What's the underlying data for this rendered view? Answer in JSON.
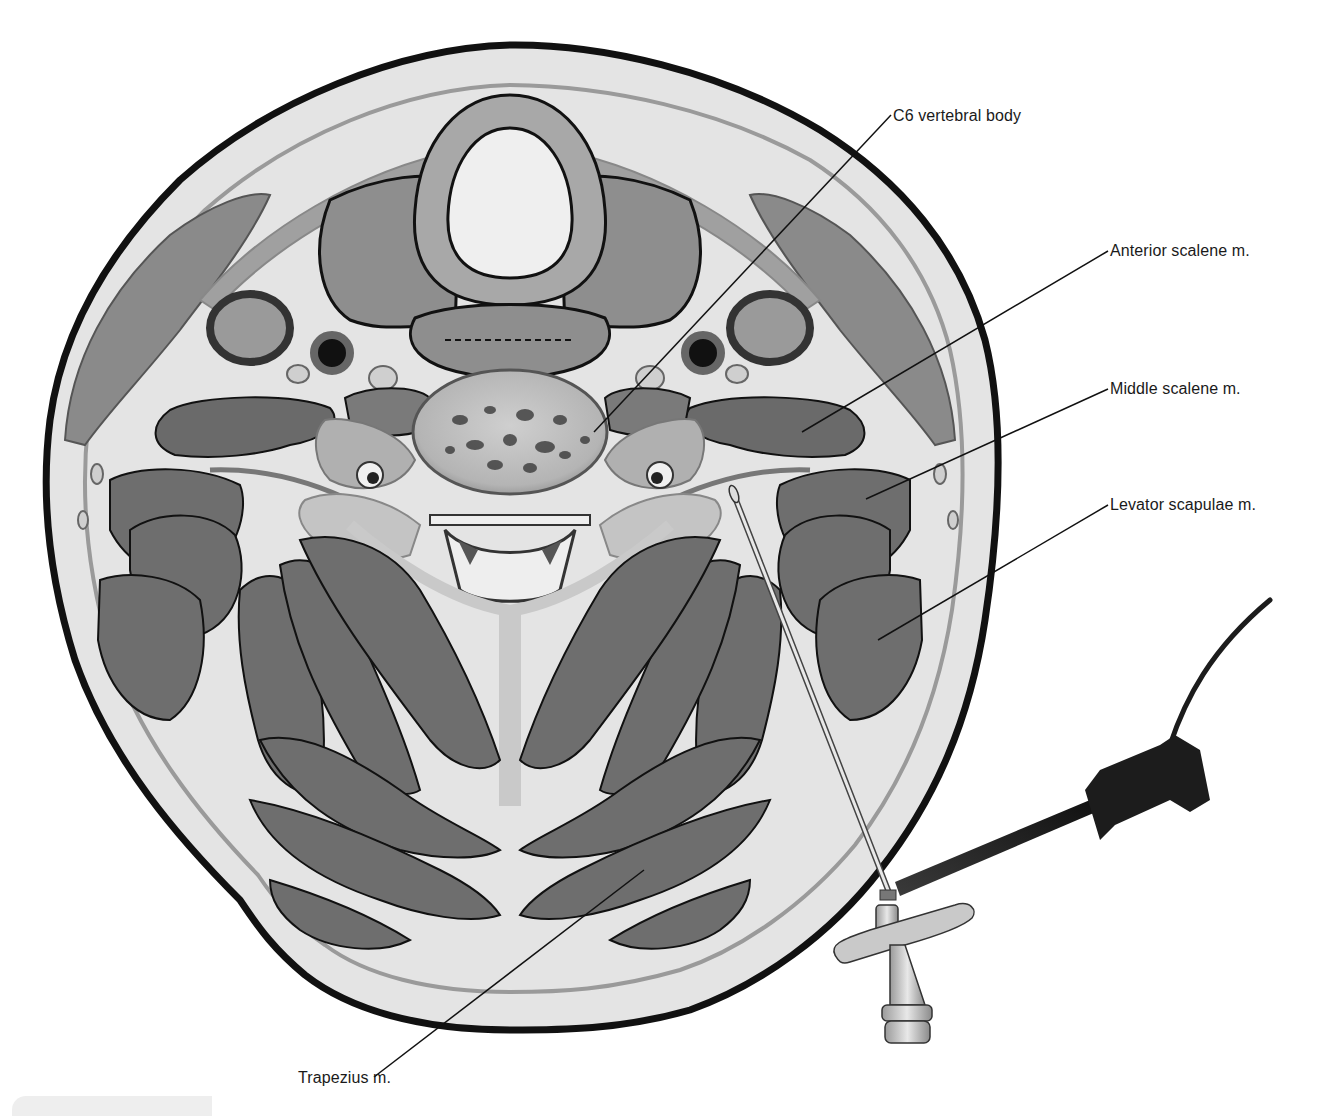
{
  "figure": {
    "colors": {
      "skin_outline": "#111111",
      "subcutaneous": "#e4e4e4",
      "fascia": "#9a9a9a",
      "muscle": "#6e6e6e",
      "muscle_dark": "#5e5e5e",
      "muscle_light": "#8a8a8a",
      "cartilage": "#a8a8a8",
      "bone": "#bdbdbd",
      "airway": "#efefef",
      "vessel_dark": "#101010",
      "leader_line": "#111111",
      "label_text": "#1a1a1a",
      "device_dark": "#1c1c1c",
      "device_light": "#c8c8c8"
    },
    "labels": [
      {
        "id": "c6",
        "text": "C6 vertebral body",
        "x": 893,
        "y": 107,
        "line_from": [
          891,
          115
        ],
        "line_to": [
          594,
          432
        ]
      },
      {
        "id": "anterior_scalene",
        "text": "Anterior scalene m.",
        "x": 1110,
        "y": 242,
        "line_from": [
          1108,
          251
        ],
        "line_to": [
          802,
          432
        ]
      },
      {
        "id": "middle_scalene",
        "text": "Middle scalene m.",
        "x": 1110,
        "y": 380,
        "line_from": [
          1108,
          389
        ],
        "line_to": [
          866,
          499
        ]
      },
      {
        "id": "levator_scapulae",
        "text": "Levator scapulae m.",
        "x": 1110,
        "y": 496,
        "line_from": [
          1108,
          505
        ],
        "line_to": [
          878,
          640
        ]
      },
      {
        "id": "trapezius",
        "text": "Trapezius m.",
        "x": 298,
        "y": 1069,
        "line_from": [
          374,
          1077
        ],
        "line_to": [
          644,
          870
        ]
      }
    ]
  }
}
